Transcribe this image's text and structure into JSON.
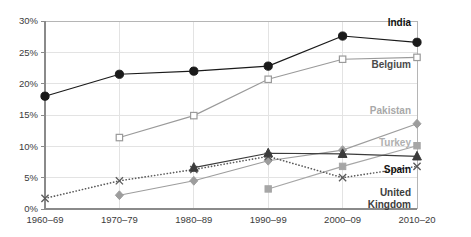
{
  "chart_data": {
    "type": "line",
    "title": "",
    "subtitle": "",
    "xlabel": "",
    "ylabel": "",
    "grid": true,
    "legend_position": "right-inline-end-of-line",
    "categories": [
      "1960–69",
      "1970–79",
      "1980–89",
      "1990–99",
      "2000–09",
      "2010–20"
    ],
    "ylim": [
      0,
      30
    ],
    "yticks": [
      0,
      5,
      10,
      15,
      20,
      25,
      30
    ],
    "ytick_labels": [
      "0%",
      "5%",
      "10%",
      "15%",
      "20%",
      "25%",
      "30%"
    ],
    "series": [
      {
        "name": "India",
        "label": "India",
        "color": "#1a1a1a",
        "label_color": "#111111",
        "marker": "circle-filled",
        "line_style": "solid",
        "values": [
          18.0,
          21.5,
          22.0,
          22.8,
          27.6,
          26.6
        ]
      },
      {
        "name": "Belgium",
        "label": "Belgium",
        "color": "#9a9a9a",
        "label_color": "#4a4a4a",
        "marker": "square-open",
        "line_style": "solid",
        "values": [
          null,
          11.4,
          14.9,
          20.7,
          23.9,
          24.2
        ]
      },
      {
        "name": "Pakistan",
        "label": "Pakistan",
        "color": "#9d9d9d",
        "label_color": "#a8a8a8",
        "marker": "diamond-filled",
        "line_style": "solid",
        "values": [
          null,
          2.2,
          4.5,
          7.7,
          9.4,
          13.6
        ]
      },
      {
        "name": "Turkey",
        "label": "Turkey",
        "color": "#a6a6a6",
        "label_color": "#b0b0b0",
        "marker": "square-filled",
        "line_style": "solid",
        "values": [
          null,
          null,
          null,
          3.2,
          6.8,
          10.1
        ]
      },
      {
        "name": "Spain",
        "label": "Spain",
        "color": "#3b3b3b",
        "label_color": "#111111",
        "marker": "triangle-filled",
        "line_style": "solid",
        "values": [
          null,
          null,
          6.6,
          8.9,
          8.8,
          8.4
        ]
      },
      {
        "name": "United Kingdom",
        "label": "United Kingdom",
        "label_line1": "United",
        "label_line2": "Kingdom",
        "color": "#5a5a5a",
        "label_color": "#3d3d3d",
        "marker": "x-cross",
        "line_style": "dotted",
        "values": [
          1.7,
          4.5,
          6.3,
          8.4,
          5.0,
          6.8
        ]
      }
    ]
  }
}
